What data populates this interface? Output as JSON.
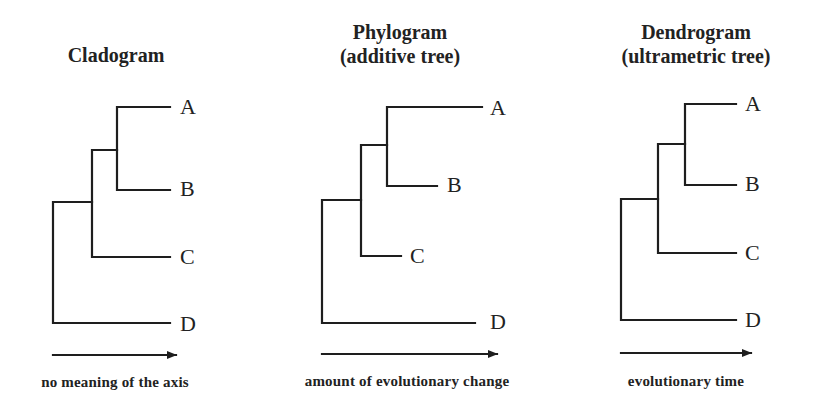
{
  "panels": [
    {
      "id": "cladogram",
      "title_line1": "Cladogram",
      "title_line2": "",
      "axis_caption": "no meaning of the axis",
      "taxa": [
        "A",
        "B",
        "C",
        "D"
      ]
    },
    {
      "id": "phylogram",
      "title_line1": "Phylogram",
      "title_line2": "(additive tree)",
      "axis_caption": "amount of evolutionary change",
      "taxa": [
        "A",
        "B",
        "C",
        "D"
      ]
    },
    {
      "id": "dendrogram",
      "title_line1": "Dendrogram",
      "title_line2": "(ultrametric tree)",
      "axis_caption": "evolutionary time",
      "taxa": [
        "A",
        "B",
        "C",
        "D"
      ]
    }
  ],
  "colors": {
    "line": "#1e1e1e",
    "background": "#ffffff"
  }
}
